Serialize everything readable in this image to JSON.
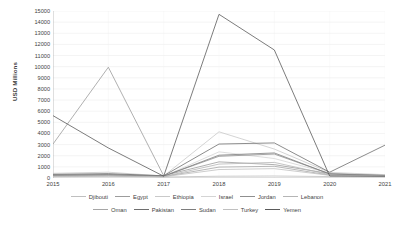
{
  "chart_data": {
    "type": "line",
    "title": "",
    "xlabel": "",
    "ylabel": "USD Millions",
    "x": [
      2015,
      2016,
      2017,
      2018,
      2019,
      2020,
      2021
    ],
    "xlim": [
      2015,
      2021
    ],
    "ylim": [
      0,
      15000
    ],
    "ytick_labels": [
      "15000",
      "14000",
      "13000",
      "12000",
      "11000",
      "10000",
      "9000",
      "8000",
      "7000",
      "6000",
      "5000",
      "4000",
      "3000",
      "2000",
      "1000",
      "0"
    ],
    "ytick_values": [
      15000,
      14000,
      13000,
      12000,
      11000,
      10000,
      9000,
      8000,
      7000,
      6000,
      5000,
      4000,
      3000,
      2000,
      1000,
      0
    ],
    "xtick_labels": [
      "2015",
      "2016",
      "2017",
      "2018",
      "2019",
      "2020",
      "2021"
    ],
    "grid": true,
    "legend_position": "bottom",
    "series": [
      {
        "name": "Djibouti",
        "color": "#bfbfbf",
        "values": [
          120,
          150,
          90,
          160,
          180,
          130,
          110
        ]
      },
      {
        "name": "Egypt",
        "color": "#9c9c9c",
        "values": [
          3050,
          9950,
          210,
          1450,
          1200,
          400,
          260
        ]
      },
      {
        "name": "Ethiopia",
        "color": "#c9c9c9",
        "values": [
          420,
          520,
          180,
          4150,
          2600,
          500,
          300
        ]
      },
      {
        "name": "Israel",
        "color": "#d4d4d4",
        "values": [
          300,
          360,
          150,
          2350,
          1750,
          420,
          240
        ]
      },
      {
        "name": "Jordan",
        "color": "#8f8f8f",
        "values": [
          260,
          310,
          170,
          1950,
          2150,
          380,
          230
        ]
      },
      {
        "name": "Lebanon",
        "color": "#b5b5b5",
        "values": [
          200,
          240,
          130,
          1250,
          1400,
          300,
          210
        ]
      },
      {
        "name": "Oman",
        "color": "#a6a6a6",
        "values": [
          180,
          210,
          120,
          980,
          1050,
          260,
          190
        ]
      },
      {
        "name": "Pakistan",
        "color": "#6e6e6e",
        "values": [
          330,
          390,
          200,
          3050,
          3150,
          520,
          2950
        ]
      },
      {
        "name": "Sudan",
        "color": "#7d7d7d",
        "values": [
          240,
          280,
          160,
          2050,
          2250,
          360,
          220
        ]
      },
      {
        "name": "Turkey",
        "color": "#c0c0c0",
        "values": [
          150,
          190,
          110,
          760,
          840,
          240,
          170
        ]
      },
      {
        "name": "Yemen",
        "color": "#5a5a5a",
        "values": [
          5600,
          2700,
          160,
          14700,
          11500,
          180,
          150
        ]
      }
    ]
  },
  "legend": {
    "row1": [
      "Djibouti",
      "Egypt",
      "Ethiopia",
      "Israel",
      "Jordan",
      "Lebanon"
    ],
    "row2": [
      "Oman",
      "Pakistan",
      "Sudan",
      "Turkey",
      "Yemen"
    ]
  }
}
